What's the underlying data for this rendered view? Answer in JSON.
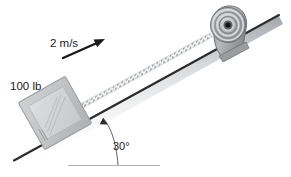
{
  "figure": {
    "type": "physics-free-body-diagram"
  },
  "labels": {
    "weight": "100 lb",
    "speed": "2 m/s",
    "angle": "30°"
  },
  "elements": {
    "block_name": "100 lb block",
    "cable_name": "cable",
    "pulley_name": "pulley",
    "incline_name": "inclined surface",
    "baseline_name": "horizontal reference line",
    "velocity_arrow_name": "velocity arrow",
    "angle_arc_name": "angle indicator"
  },
  "colors": {
    "incline_line": "#2b2b2b",
    "incline_shade": "#b9bcc0",
    "block_fill": "#c3c5c7",
    "block_inner": "#d2d4d6",
    "block_edge": "#9a9c9e",
    "pulley_body": "#a8abae",
    "pulley_ring_light": "#d8dadc",
    "pulley_ring_dark": "#6e7174",
    "pulley_hub": "#141414",
    "cable": "#8e9194",
    "baseline": "#b0b3b6",
    "text": "#1a1a1a",
    "arrow": "#1a1a1a",
    "background": "#ffffff"
  },
  "geometry": {
    "incline_angle_degrees": 30,
    "incline_start": [
      14,
      160
    ],
    "incline_end": [
      279,
      15
    ],
    "baseline_start": [
      68,
      165
    ],
    "baseline_end": [
      160,
      165
    ],
    "pulley_center": [
      228,
      24
    ],
    "pulley_radius": 17,
    "block_center": [
      55,
      113
    ],
    "block_size": 54,
    "velocity_arrow_start": [
      63,
      57
    ],
    "velocity_arrow_end": [
      104,
      39
    ]
  }
}
